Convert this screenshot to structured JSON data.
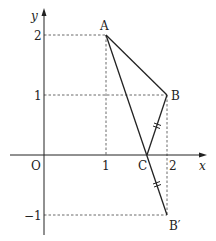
{
  "diagram": {
    "type": "coordinate-geometry",
    "axes": {
      "x_label": "x",
      "y_label": "y",
      "origin_label": "O",
      "x_ticks": [
        "1",
        "2"
      ],
      "y_ticks": [
        "2",
        "1",
        "−1"
      ]
    },
    "points": [
      {
        "name": "A",
        "label": "A",
        "x": 1,
        "y": 2
      },
      {
        "name": "B",
        "label": "B",
        "x": 2,
        "y": 1
      },
      {
        "name": "C",
        "label": "C",
        "x": 1.67,
        "y": 0
      },
      {
        "name": "B'",
        "label": "B′",
        "x": 2,
        "y": -1
      }
    ],
    "segments": [
      "AB",
      "AC",
      "BC",
      "CB'"
    ],
    "equal_marks": [
      "BC",
      "CB'"
    ],
    "colors": {
      "line": "#222222",
      "dash": "#444444"
    }
  }
}
